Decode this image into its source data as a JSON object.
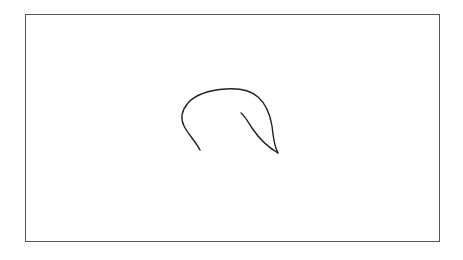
{
  "canvas": {
    "width": 463,
    "height": 260,
    "background": "#ffffff",
    "frame": {
      "x": 25,
      "y": 14,
      "width": 413,
      "height": 226,
      "border_color": "#555555"
    },
    "sketch": {
      "stroke_color": "#222222",
      "stroke_width": 1.4,
      "strokes": [
        {
          "name": "outer-curve",
          "path": "M200,150 C196,142 188,134 184,126 C180,118 182,110 188,103 C196,94 210,90 226,89 C240,88 250,90 258,97 C266,104 270,114 272,126 C273,136 274,146 278,153"
        },
        {
          "name": "inner-stroke",
          "path": "M241,113 C245,116 248,122 252,128 C258,137 266,146 278,153"
        }
      ]
    }
  }
}
